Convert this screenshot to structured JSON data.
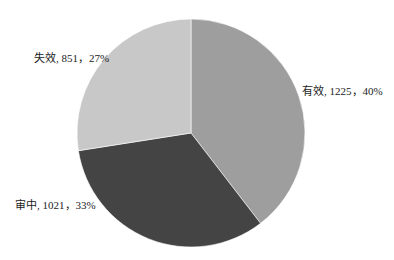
{
  "chart_data": {
    "type": "pie",
    "title": "",
    "start_angle_deg": 0,
    "direction": "clockwise",
    "slices": [
      {
        "name": "有效",
        "value": 1225,
        "percent": 40,
        "label": "有效, 1225，40%",
        "color": "#9e9e9e"
      },
      {
        "name": "审中",
        "value": 1021,
        "percent": 33,
        "label": "审中, 1021，33%",
        "color": "#444444"
      },
      {
        "name": "失效",
        "value": 851,
        "percent": 27,
        "label": "失效, 851，27%",
        "color": "#c8c8c8"
      }
    ],
    "legend": "none",
    "data_labels": "category, value, percent"
  },
  "labels": {
    "valid": "有效, 1225，40%",
    "pending": "审中, 1021，33%",
    "invalid": "失效, 851，27%"
  }
}
